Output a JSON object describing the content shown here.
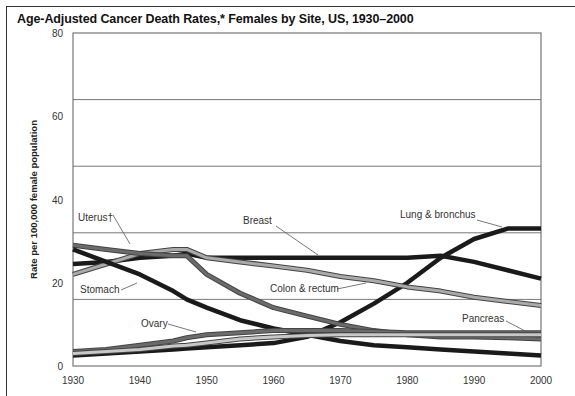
{
  "chart_data": {
    "type": "line",
    "title": "Age-Adjusted Cancer Death Rates,* Females by Site, US, 1930–2000",
    "xlabel": "",
    "ylabel": "Rate per 100,000 female population",
    "xlim": [
      1930,
      2000
    ],
    "ylim": [
      0,
      80
    ],
    "x_ticks": [
      "1930",
      "1940",
      "1950",
      "1960",
      "1970",
      "1980",
      "1990",
      "2000"
    ],
    "y_ticks": [
      "0",
      "20",
      "40",
      "60",
      "80"
    ],
    "gridlines_y": [
      16,
      32,
      48,
      64
    ],
    "x": [
      1930,
      1935,
      1940,
      1945,
      1947,
      1950,
      1955,
      1960,
      1965,
      1970,
      1975,
      1980,
      1985,
      1990,
      1995,
      2000
    ],
    "series": [
      {
        "name": "Lung & bronchus",
        "color": "#1a1a1a",
        "values": [
          2.5,
          3,
          3.5,
          4,
          4.2,
          4.5,
          5,
          5.5,
          7,
          10.5,
          15,
          20,
          26,
          30.5,
          33,
          33
        ]
      },
      {
        "name": "Breast",
        "color": "#1a1a1a",
        "values": [
          24.5,
          25,
          26,
          26.5,
          27,
          26,
          26,
          26,
          26,
          26,
          26,
          26,
          26.5,
          25,
          23,
          21
        ]
      },
      {
        "name": "Colon & rectum",
        "color": "#aaaaaa",
        "values": [
          22,
          24.5,
          27,
          28,
          28,
          26,
          25,
          24,
          23,
          21.5,
          20.5,
          19,
          18,
          16.5,
          15.5,
          14.5
        ]
      },
      {
        "name": "Uterus†",
        "color": "#6b6b6b",
        "values": [
          29,
          28,
          27,
          26.5,
          26.5,
          22,
          17.5,
          14,
          12,
          10,
          8.5,
          7.5,
          7,
          7,
          6.8,
          6.5
        ]
      },
      {
        "name": "Stomach",
        "color": "#1a1a1a",
        "values": [
          28,
          25,
          22,
          18,
          16,
          14,
          11,
          9,
          7.5,
          6,
          5,
          4.5,
          4,
          3.5,
          3,
          2.5
        ]
      },
      {
        "name": "Ovary",
        "color": "#6b6b6b",
        "values": [
          3.5,
          4,
          5,
          6,
          6.8,
          7.5,
          8,
          8.5,
          8.5,
          8.5,
          8.3,
          8,
          8,
          8,
          8,
          8
        ]
      },
      {
        "name": "Pancreas",
        "color": "#c8c8c8",
        "values": [
          3,
          3.5,
          4,
          4.8,
          5,
          5.5,
          6.5,
          7,
          7.3,
          7.5,
          7.5,
          7.5,
          7.5,
          7.5,
          7.5,
          7.5
        ]
      }
    ],
    "annotations": [
      {
        "text": "Uterus†",
        "series": "Uterus†"
      },
      {
        "text": "Breast",
        "series": "Breast"
      },
      {
        "text": "Lung & bronchus",
        "series": "Lung & bronchus"
      },
      {
        "text": "Stomach",
        "series": "Stomach"
      },
      {
        "text": "Colon & rectum",
        "series": "Colon & rectum"
      },
      {
        "text": "Ovary",
        "series": "Ovary"
      },
      {
        "text": "Pancreas",
        "series": "Pancreas"
      }
    ],
    "legend": "inline labels",
    "grid": true
  }
}
